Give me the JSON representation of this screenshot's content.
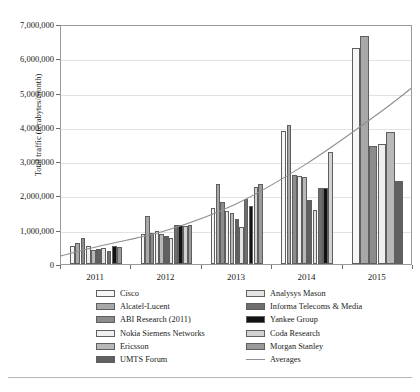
{
  "chart_data": {
    "type": "bar",
    "title": "",
    "xlabel": "",
    "ylabel": "Total traffic (terabytes/month)",
    "ylim": [
      0,
      7000000
    ],
    "ytick_labels": [
      "0",
      "1,000,000",
      "2,000,000",
      "3,000,000",
      "4,000,000",
      "5,000,000",
      "6,000,000",
      "7,000,000"
    ],
    "ytick_values": [
      0,
      1000000,
      2000000,
      3000000,
      4000000,
      5000000,
      6000000,
      7000000
    ],
    "grid": true,
    "legend_position": "bottom",
    "categories": [
      "2011",
      "2012",
      "2013",
      "2014",
      "2015"
    ],
    "series": [
      {
        "name": "Cisco",
        "color": "#f7f7f7",
        "values": [
          530000,
          880000,
          1640000,
          3870000,
          6300000
        ]
      },
      {
        "name": "Alcatel-Lucent",
        "color": "#a8a8a8",
        "values": [
          620000,
          1400000,
          2340000,
          4050000,
          6650000
        ]
      },
      {
        "name": "ABI Research (2011)",
        "color": "#8c8c8c",
        "values": [
          760000,
          900000,
          1800000,
          2600000,
          3450000
        ]
      },
      {
        "name": "Nokia Siemens Networks",
        "color": "#efefef",
        "values": [
          530000,
          950000,
          1560000,
          2580000,
          3500000
        ]
      },
      {
        "name": "Ericsson",
        "color": "#b8b8b8",
        "values": [
          400000,
          880000,
          1490000,
          2530000,
          3850000
        ]
      },
      {
        "name": "UMTS Forum",
        "color": "#606060",
        "values": [
          430000,
          820000,
          1300000,
          1880000,
          2430000
        ]
      },
      {
        "name": "Analysys Mason",
        "color": "#e4e4e4",
        "values": [
          470000,
          760000,
          1080000,
          1580000,
          null
        ]
      },
      {
        "name": "Informa Telecoms & Media",
        "color": "#6e6e6e",
        "values": [
          380000,
          1150000,
          1900000,
          2230000,
          null
        ]
      },
      {
        "name": "Yankee Group",
        "color": "#121212",
        "values": [
          520000,
          1150000,
          1680000,
          2230000,
          null
        ]
      },
      {
        "name": "Coda Research",
        "color": "#d2d2d2",
        "values": [
          null,
          1120000,
          2260000,
          3280000,
          null
        ]
      },
      {
        "name": "Morgan Stanley",
        "color": "#9a9a9a",
        "values": [
          510000,
          1130000,
          2330000,
          null,
          null
        ]
      }
    ],
    "trend": {
      "name": "Averages",
      "color": "#8f8f8f",
      "points": [
        {
          "x": 2011,
          "y": 520000
        },
        {
          "x": 2012,
          "y": 1000000
        },
        {
          "x": 2013,
          "y": 1780000
        },
        {
          "x": 2014,
          "y": 2950000
        },
        {
          "x": 2015,
          "y": 4380000
        }
      ]
    }
  },
  "legend": {
    "left_column": [
      {
        "label": "Cisco",
        "color": "#f7f7f7",
        "kind": "swatch"
      },
      {
        "label": "Alcatel-Lucent",
        "color": "#a8a8a8",
        "kind": "swatch"
      },
      {
        "label": "ABI Research (2011)",
        "color": "#8c8c8c",
        "kind": "swatch"
      },
      {
        "label": "Nokia Siemens Networks",
        "color": "#efefef",
        "kind": "swatch"
      },
      {
        "label": "Ericsson",
        "color": "#b8b8b8",
        "kind": "swatch"
      },
      {
        "label": "UMTS Forum",
        "color": "#606060",
        "kind": "swatch"
      }
    ],
    "right_column": [
      {
        "label": "Analysys Mason",
        "color": "#e4e4e4",
        "kind": "swatch"
      },
      {
        "label": "Informa Telecoms & Media",
        "color": "#6e6e6e",
        "kind": "swatch"
      },
      {
        "label": "Yankee Group",
        "color": "#121212",
        "kind": "swatch"
      },
      {
        "label": "Coda Research",
        "color": "#d2d2d2",
        "kind": "swatch"
      },
      {
        "label": "Morgan Stanley",
        "color": "#9a9a9a",
        "kind": "swatch"
      },
      {
        "label": "Averages",
        "color": "#8f8f8f",
        "kind": "line"
      }
    ]
  },
  "axes": {
    "x_labels": [
      "2011",
      "2012",
      "2013",
      "2014",
      "2015"
    ]
  }
}
